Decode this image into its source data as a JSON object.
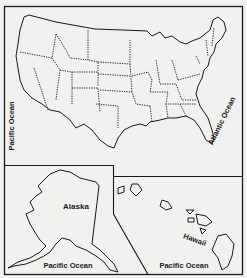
{
  "map": {
    "title_fragment": "...p.g...",
    "regions": [
      {
        "name": "Contiguous United States",
        "type": "main-map"
      },
      {
        "name": "Alaska",
        "type": "inset"
      },
      {
        "name": "Hawaii",
        "type": "inset"
      }
    ],
    "labels": {
      "pacific_main": "Pacific Ocean",
      "atlantic": "Atlantic Ocean",
      "alaska": "Alaska",
      "pacific_alaska": "Pacific Ocean",
      "hawaii": "Hawaii",
      "pacific_hawaii": "Pacific Ocean"
    },
    "colors": {
      "background": "#f1f1ef",
      "lines": "#1a1a1a",
      "text": "#1a1a1a"
    }
  }
}
